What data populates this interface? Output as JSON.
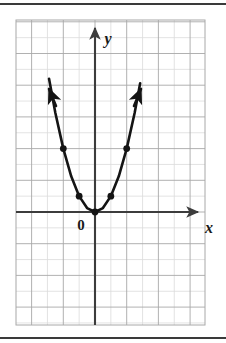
{
  "figure": {
    "kind": "coordinate-plane-graph",
    "background_color": "#ffffff",
    "rule_color": "#3a3a3a",
    "top_rule": "horizontal-rule",
    "bottom_rule": "horizontal-rule"
  },
  "labels": {
    "origin": "0",
    "x_axis": "x",
    "y_axis": "y"
  },
  "colors": {
    "grid_minor": "#d9d9d9",
    "grid_major": "#9a9a9a",
    "axis": "#3c3c3c",
    "curve": "#141414",
    "point": "#141414",
    "text": "#1a1a1a"
  },
  "chart_data": {
    "type": "line",
    "title": "",
    "xlabel": "x",
    "ylabel": "y",
    "grid": true,
    "legend": "none",
    "equation": "y = x^2",
    "curve_name": "parabola",
    "xlim": [
      -5,
      7
    ],
    "ylim": [
      -7,
      12
    ],
    "x_tick_step": 1,
    "y_tick_step": 1,
    "origin_label": "0",
    "x": [
      -2.9,
      -2.5,
      -2,
      -1.5,
      -1,
      -0.5,
      0,
      0.5,
      1,
      1.5,
      2,
      2.5,
      2.85
    ],
    "y": [
      8.41,
      6.25,
      4,
      2.25,
      1,
      0.25,
      0,
      0.25,
      1,
      2.25,
      4,
      6.25,
      8.12
    ],
    "marked_points": [
      {
        "x": -2,
        "y": 4
      },
      {
        "x": -1,
        "y": 1
      },
      {
        "x": 0,
        "y": 0
      },
      {
        "x": 1,
        "y": 1
      },
      {
        "x": 2,
        "y": 4
      }
    ],
    "arrows": [
      "curve-left-end",
      "curve-right-end",
      "x-axis-right",
      "y-axis-up"
    ]
  }
}
